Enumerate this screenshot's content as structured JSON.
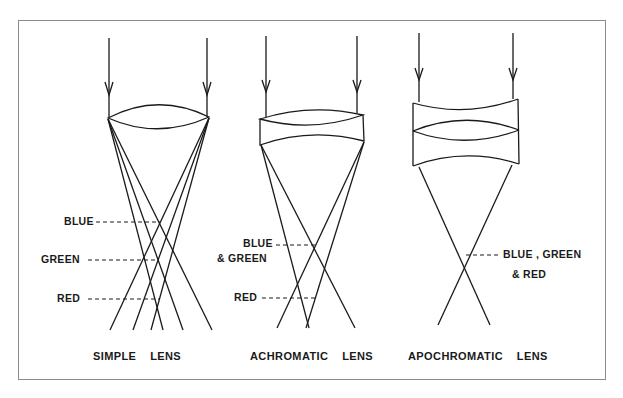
{
  "diagram": {
    "panels": [
      {
        "id": "simple",
        "caption": "SIMPLE    LENS",
        "focus_labels": {
          "blue": "BLUE",
          "green": "GREEN",
          "red": "RED"
        }
      },
      {
        "id": "achromatic",
        "caption": "ACHROMATIC    LENS",
        "focus_labels": {
          "blue": "BLUE",
          "green": "& GREEN",
          "red": "RED"
        }
      },
      {
        "id": "apochromatic",
        "caption": "APOCHROMATIC    LENS",
        "focus_labels": {
          "combined_line1": "BLUE , GREEN",
          "combined_line2": "& RED"
        }
      }
    ],
    "colors": {
      "line": "#1a1a1a",
      "frame": "#8a8a8a",
      "background": "#ffffff"
    }
  }
}
